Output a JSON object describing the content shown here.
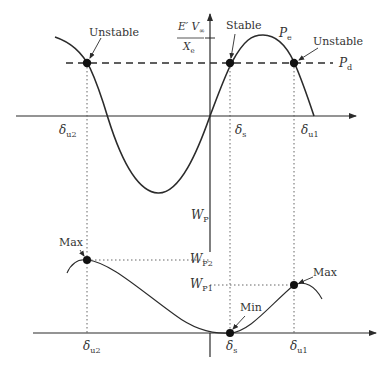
{
  "top_plot": {
    "curve_name": "P",
    "curve_sub": "e",
    "demand_name": "P",
    "demand_sub": "d",
    "amplitude_label": {
      "numerator": "E′ V",
      "numerator_sub": "∞",
      "denominator": "X",
      "denominator_sub": "e"
    },
    "points": [
      {
        "label": "Unstable",
        "angle": "δ",
        "angle_sub": "u2"
      },
      {
        "label": "Stable",
        "angle": "δ",
        "angle_sub": "s"
      },
      {
        "label": "Unstable",
        "angle": "δ",
        "angle_sub": "u1"
      }
    ]
  },
  "bottom_plot": {
    "axis_label": "W",
    "axis_sub": "P",
    "levels": [
      {
        "label": "W",
        "sub": "P2"
      },
      {
        "label": "W",
        "sub": "P1"
      }
    ],
    "points": [
      {
        "label": "Max",
        "angle": "δ",
        "angle_sub": "u2"
      },
      {
        "label": "Min",
        "angle": "δ",
        "angle_sub": "s"
      },
      {
        "label": "Max",
        "angle": "δ",
        "angle_sub": "u1"
      }
    ]
  },
  "colors": {
    "line": "#2b2b2b",
    "text": "#333333",
    "background": "#ffffff"
  }
}
